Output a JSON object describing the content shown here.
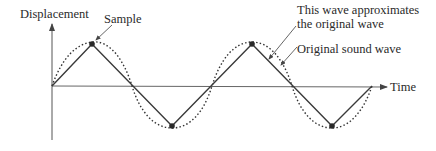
{
  "labels": {
    "y_axis": "Displacement",
    "x_axis": "Time",
    "sample": "Sample",
    "approx_line1": "This wave approximates",
    "approx_line2": "the original wave",
    "original": "Original sound wave"
  },
  "colors": {
    "stroke": "#3a3a3a",
    "axis": "#555555",
    "text": "#2a2a2a",
    "sample_dot": "#2a2a2a"
  },
  "series": {
    "sampled_triangle_wave_points": [
      [
        52,
        86
      ],
      [
        92,
        44
      ],
      [
        172,
        126
      ],
      [
        252,
        44
      ],
      [
        332,
        126
      ],
      [
        372,
        86
      ]
    ],
    "original_wave": "sinusoid dotted, same period (160px), peaks at x=92 and 252, troughs at x=172 and 332"
  }
}
